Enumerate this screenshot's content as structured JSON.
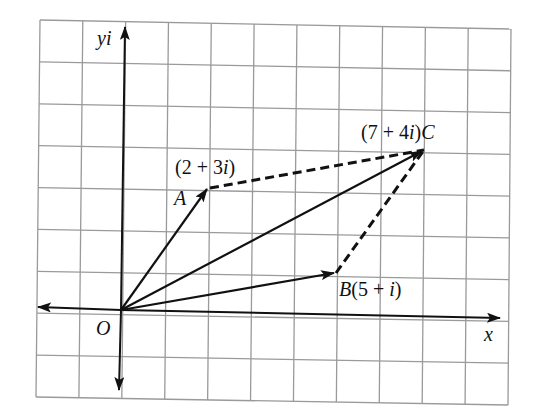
{
  "diagram": {
    "title": "",
    "type": "argand-diagram-vector-addition",
    "colors": {
      "grid": "#9a9a9a",
      "ink": "#111111",
      "background": "#ffffff"
    },
    "axes": {
      "x_label": "x",
      "y_label": "yi",
      "origin_label": "O"
    },
    "grid": {
      "columns": 11,
      "rows": 9,
      "origin_col": 2,
      "origin_row": 7
    },
    "points": [
      {
        "name": "A",
        "value": "2 + 3i",
        "label": "(2 + 3i)",
        "letter": "A",
        "re": 2,
        "im": 3
      },
      {
        "name": "B",
        "value": "5 + i",
        "label": "B(5 + i)",
        "letter": "B",
        "re": 5,
        "im": 1
      },
      {
        "name": "C",
        "value": "7 + 4i",
        "label": "(7 + 4i)C",
        "letter": "C",
        "re": 7,
        "im": 4
      }
    ],
    "vectors": [
      {
        "from": "O",
        "to": "A",
        "style": "solid-arrow"
      },
      {
        "from": "O",
        "to": "B",
        "style": "solid-arrow"
      },
      {
        "from": "O",
        "to": "C",
        "style": "solid-arrow"
      },
      {
        "from": "A",
        "to": "C",
        "style": "dashed"
      },
      {
        "from": "B",
        "to": "C",
        "style": "dashed"
      }
    ]
  },
  "labels": {
    "yi": "yi",
    "x": "x",
    "O": "O",
    "A_coord": "(2 + 3i)",
    "A_letter": "A",
    "B_full": "B(5 + i)",
    "C_full": "(7 + 4i)C"
  }
}
